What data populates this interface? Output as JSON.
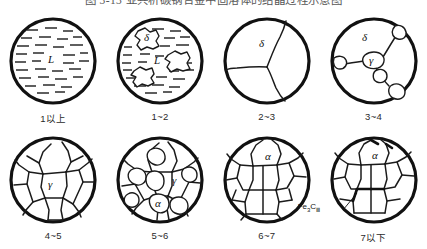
{
  "figure": {
    "title": "图 3-13  亚共析碳钢合金中固溶体的结晶过程示意图",
    "title_clipped": true
  },
  "diagram": {
    "type": "solidification-stage-series",
    "panel_count": 8,
    "rows": 2,
    "columns": 4,
    "panels": [
      {
        "id": "panel-1",
        "caption": "1以上",
        "structure": "liquid",
        "phase_labels": [
          "L"
        ],
        "description": "fully liquid melt shown as horizontal dashes"
      },
      {
        "id": "panel-2",
        "caption": "1~2",
        "structure": "liquid-plus-delta",
        "phase_labels": [
          "δ",
          "L"
        ],
        "description": "delta ferrite dendritic islands nucleating in liquid"
      },
      {
        "id": "panel-3",
        "caption": "2~3",
        "structure": "delta-grains",
        "phase_labels": [
          "δ"
        ],
        "description": "three coarse delta ferrite grains, solidification complete"
      },
      {
        "id": "panel-4",
        "caption": "3~4",
        "structure": "delta-plus-gamma",
        "phase_labels": [
          "δ",
          "γ"
        ],
        "description": "austenite nucleating on delta grain boundaries"
      },
      {
        "id": "panel-5",
        "caption": "4~5",
        "structure": "gamma-grains",
        "phase_labels": [
          "γ"
        ],
        "description": "fully austenitic polygonal grain structure"
      },
      {
        "id": "panel-6",
        "caption": "5~6",
        "structure": "gamma-plus-alpha",
        "phase_labels": [
          "γ",
          "α"
        ],
        "description": "ferrite nucleating at austenite grain boundaries"
      },
      {
        "id": "panel-7",
        "caption": "6~7",
        "structure": "alpha-grains",
        "phase_labels": [
          "α"
        ],
        "description": "fully ferritic polygonal grain structure"
      },
      {
        "id": "panel-8",
        "caption": "7以下",
        "structure": "alpha-plus-carbide",
        "phase_labels": [
          "α"
        ],
        "callout": "Fe₃C",
        "callout_main": "Fe",
        "callout_sub1": "3",
        "callout_mid": "C",
        "callout_sub2": "Ⅲ",
        "description": "tertiary cementite precipitating on ferrite grain boundaries"
      }
    ]
  },
  "colors": {
    "ink": "#111111",
    "line": "#1b1b1b",
    "background": "#ffffff"
  }
}
